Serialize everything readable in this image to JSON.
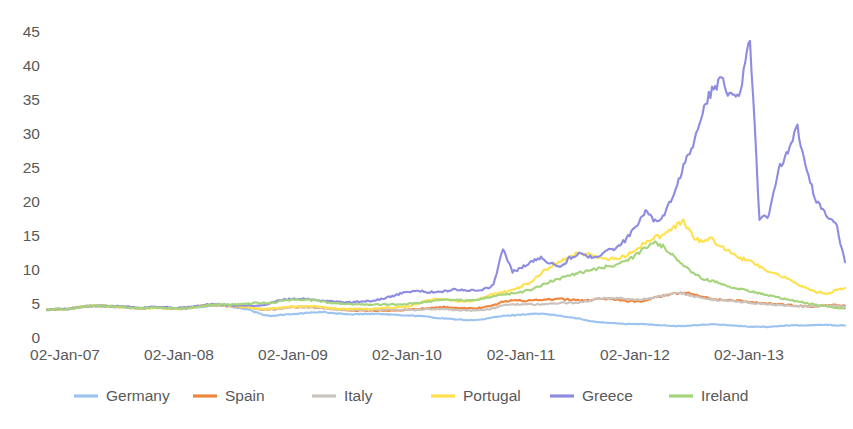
{
  "chart_data": {
    "type": "line",
    "title": "",
    "subtitle": "",
    "xlabel": "",
    "ylabel": "",
    "xlim": [
      0,
      84
    ],
    "ylim": [
      0,
      45
    ],
    "grid": false,
    "legend_position": "bottom",
    "y_ticks": [
      "0",
      "5",
      "10",
      "15",
      "20",
      "25",
      "30",
      "35",
      "40",
      "45"
    ],
    "y_tick_values": [
      0,
      5,
      10,
      15,
      20,
      25,
      30,
      35,
      40,
      45
    ],
    "x_ticks": [
      "02-Jan-07",
      "02-Jan-08",
      "02-Jan-09",
      "02-Jan-10",
      "02-Jan-11",
      "02-Jan-12",
      "02-Jan-13"
    ],
    "x_tick_values": [
      0,
      12,
      24,
      36,
      48,
      60,
      72
    ],
    "x_note": "x values are months elapsed since 02-Jan-2007; series sampled approximately monthly, 85 points spanning 02-Jan-07 to late 2013",
    "series": [
      {
        "name": "Germany",
        "color": "#9DC3F0",
        "values": [
          4.0,
          4.1,
          4.1,
          4.3,
          4.5,
          4.6,
          4.5,
          4.4,
          4.4,
          4.3,
          4.2,
          4.3,
          4.3,
          4.2,
          4.1,
          4.2,
          4.4,
          4.6,
          4.6,
          4.5,
          4.3,
          4.1,
          3.6,
          3.2,
          3.1,
          3.3,
          3.4,
          3.5,
          3.6,
          3.7,
          3.5,
          3.4,
          3.3,
          3.4,
          3.4,
          3.4,
          3.3,
          3.2,
          3.2,
          3.1,
          3.0,
          2.8,
          2.7,
          2.6,
          2.5,
          2.5,
          2.6,
          2.9,
          3.1,
          3.2,
          3.3,
          3.4,
          3.4,
          3.3,
          3.1,
          2.9,
          2.7,
          2.4,
          2.2,
          2.1,
          2.0,
          1.9,
          1.9,
          1.9,
          1.8,
          1.7,
          1.6,
          1.6,
          1.7,
          1.8,
          1.9,
          1.8,
          1.7,
          1.6,
          1.5,
          1.5,
          1.5,
          1.6,
          1.7,
          1.7,
          1.7,
          1.8,
          1.8,
          1.7,
          1.7
        ]
      },
      {
        "name": "Spain",
        "color": "#F0853C",
        "values": [
          4.0,
          4.1,
          4.1,
          4.3,
          4.5,
          4.6,
          4.6,
          4.5,
          4.4,
          4.3,
          4.2,
          4.3,
          4.3,
          4.2,
          4.2,
          4.3,
          4.5,
          4.7,
          4.7,
          4.6,
          4.5,
          4.4,
          4.2,
          4.0,
          4.1,
          4.3,
          4.4,
          4.4,
          4.4,
          4.3,
          4.1,
          4.0,
          3.9,
          3.9,
          3.9,
          3.9,
          3.9,
          3.9,
          4.0,
          4.1,
          4.2,
          4.3,
          4.4,
          4.3,
          4.2,
          4.2,
          4.4,
          4.6,
          5.2,
          5.4,
          5.3,
          5.4,
          5.4,
          5.5,
          5.6,
          5.5,
          5.4,
          5.4,
          5.6,
          5.6,
          5.5,
          5.3,
          5.2,
          5.4,
          5.8,
          6.1,
          6.4,
          6.6,
          6.3,
          5.9,
          5.6,
          5.5,
          5.4,
          5.3,
          5.1,
          5.0,
          4.9,
          4.8,
          4.7,
          4.6,
          4.5,
          4.5,
          4.6,
          4.7,
          4.6
        ]
      },
      {
        "name": "Italy",
        "color": "#C9C2BD",
        "values": [
          4.0,
          4.1,
          4.1,
          4.3,
          4.5,
          4.6,
          4.5,
          4.5,
          4.4,
          4.3,
          4.2,
          4.3,
          4.3,
          4.2,
          4.2,
          4.3,
          4.5,
          4.7,
          4.7,
          4.6,
          4.5,
          4.4,
          4.2,
          4.0,
          4.1,
          4.3,
          4.4,
          4.4,
          4.4,
          4.3,
          4.1,
          4.0,
          4.0,
          4.0,
          4.0,
          4.0,
          4.0,
          4.0,
          4.0,
          4.0,
          4.1,
          4.1,
          4.1,
          4.0,
          3.9,
          3.9,
          4.0,
          4.2,
          4.7,
          4.8,
          4.8,
          4.8,
          4.8,
          4.9,
          5.0,
          5.0,
          5.1,
          5.3,
          5.6,
          5.7,
          5.7,
          5.6,
          5.5,
          5.6,
          5.9,
          6.2,
          6.5,
          6.4,
          6.0,
          5.7,
          5.5,
          5.4,
          5.3,
          5.2,
          5.0,
          4.9,
          4.8,
          4.7,
          4.6,
          4.5,
          4.5,
          4.5,
          4.6,
          4.6,
          4.5
        ]
      },
      {
        "name": "Portugal",
        "color": "#FFE14D",
        "values": [
          4.0,
          4.1,
          4.1,
          4.3,
          4.5,
          4.6,
          4.5,
          4.5,
          4.4,
          4.3,
          4.2,
          4.3,
          4.3,
          4.2,
          4.2,
          4.3,
          4.5,
          4.7,
          4.7,
          4.6,
          4.5,
          4.4,
          4.2,
          4.1,
          4.2,
          4.4,
          4.5,
          4.5,
          4.5,
          4.4,
          4.2,
          4.1,
          4.1,
          4.1,
          4.1,
          4.2,
          4.3,
          4.4,
          4.5,
          4.9,
          5.4,
          5.6,
          5.5,
          5.3,
          5.2,
          5.4,
          5.9,
          6.3,
          6.6,
          6.9,
          7.5,
          8.2,
          9.4,
          10.4,
          11.2,
          11.9,
          12.3,
          12.1,
          11.8,
          11.5,
          11.4,
          12.0,
          13.0,
          13.8,
          14.6,
          15.0,
          16.2,
          17.0,
          14.8,
          13.9,
          14.4,
          13.2,
          12.4,
          11.5,
          11.4,
          10.3,
          9.6,
          9.2,
          8.6,
          7.8,
          7.2,
          6.6,
          6.4,
          6.8,
          7.2
        ]
      },
      {
        "name": "Greece",
        "color": "#8E8CE0",
        "values": [
          4.0,
          4.1,
          4.1,
          4.3,
          4.5,
          4.6,
          4.6,
          4.5,
          4.5,
          4.4,
          4.3,
          4.4,
          4.4,
          4.3,
          4.3,
          4.4,
          4.6,
          4.8,
          4.8,
          4.7,
          4.6,
          4.6,
          4.6,
          4.8,
          5.2,
          5.5,
          5.6,
          5.6,
          5.5,
          5.4,
          5.2,
          5.1,
          5.1,
          5.2,
          5.3,
          5.5,
          5.9,
          6.3,
          6.7,
          6.8,
          6.6,
          6.6,
          6.8,
          7.0,
          6.9,
          6.8,
          7.0,
          7.6,
          13.0,
          9.6,
          10.2,
          11.2,
          11.6,
          10.9,
          10.2,
          11.6,
          12.2,
          11.8,
          12.0,
          12.6,
          13.2,
          14.4,
          16.4,
          18.4,
          17.0,
          18.0,
          21.0,
          25.0,
          28.5,
          33.0,
          36.5,
          37.8,
          35.5,
          36.2,
          44.0,
          17.2,
          18.0,
          24.5,
          27.5,
          30.8,
          24.0,
          20.0,
          18.0,
          17.0,
          11.0
        ]
      },
      {
        "name": "Ireland",
        "color": "#A5D47C",
        "values": [
          4.0,
          4.1,
          4.1,
          4.3,
          4.5,
          4.6,
          4.6,
          4.5,
          4.4,
          4.3,
          4.2,
          4.3,
          4.3,
          4.2,
          4.2,
          4.3,
          4.5,
          4.7,
          4.8,
          4.8,
          4.8,
          4.9,
          5.0,
          5.0,
          5.1,
          5.4,
          5.5,
          5.5,
          5.4,
          5.2,
          5.0,
          4.9,
          4.8,
          4.8,
          4.8,
          4.8,
          4.8,
          4.8,
          4.9,
          5.0,
          5.2,
          5.4,
          5.6,
          5.5,
          5.4,
          5.4,
          5.6,
          6.0,
          6.2,
          6.4,
          6.6,
          7.0,
          7.6,
          8.2,
          8.6,
          9.0,
          9.4,
          9.8,
          10.0,
          10.4,
          10.6,
          11.2,
          12.0,
          13.2,
          13.9,
          13.2,
          11.8,
          10.4,
          9.4,
          8.6,
          8.2,
          7.8,
          7.4,
          7.0,
          6.8,
          6.4,
          6.1,
          5.8,
          5.5,
          5.2,
          5.0,
          4.7,
          4.5,
          4.3,
          4.2
        ]
      }
    ]
  },
  "legend": {
    "items": [
      {
        "label": "Germany",
        "color": "#9DC3F0"
      },
      {
        "label": "Spain",
        "color": "#F0853C"
      },
      {
        "label": "Italy",
        "color": "#C9C2BD"
      },
      {
        "label": "Portugal",
        "color": "#FFE14D"
      },
      {
        "label": "Greece",
        "color": "#8E8CE0"
      },
      {
        "label": "Ireland",
        "color": "#A5D47C"
      }
    ]
  },
  "axes": {
    "y_tick_labels": [
      "45",
      "40",
      "35",
      "30",
      "25",
      "20",
      "15",
      "10",
      "5",
      "0"
    ],
    "x_tick_labels": [
      "02-Jan-07",
      "02-Jan-08",
      "02-Jan-09",
      "02-Jan-10",
      "02-Jan-11",
      "02-Jan-12",
      "02-Jan-13"
    ]
  }
}
